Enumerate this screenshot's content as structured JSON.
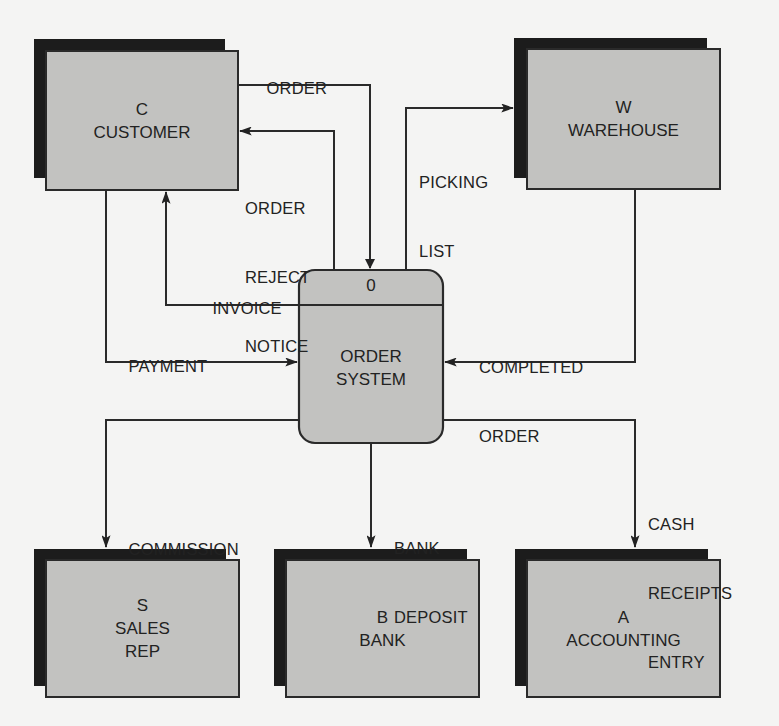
{
  "diagram": {
    "type": "context data flow diagram",
    "process": {
      "id": "0",
      "name_line1": "ORDER",
      "name_line2": "SYSTEM"
    },
    "entities": {
      "customer": {
        "code": "C",
        "name": "CUSTOMER"
      },
      "warehouse": {
        "code": "W",
        "name": "WAREHOUSE"
      },
      "sales_rep": {
        "code": "S",
        "name_line1": "SALES",
        "name_line2": "REP"
      },
      "bank": {
        "code": "B",
        "name": "BANK"
      },
      "accounting": {
        "code": "A",
        "name": "ACCOUNTING"
      }
    },
    "flows": {
      "order": {
        "line1": "ORDER",
        "from": "CUSTOMER",
        "to": "ORDER SYSTEM"
      },
      "order_reject": {
        "line1": "ORDER",
        "line2": "REJECT",
        "line3": "NOTICE",
        "from": "ORDER SYSTEM",
        "to": "CUSTOMER"
      },
      "invoice": {
        "line1": "INVOICE",
        "from": "ORDER SYSTEM",
        "to": "CUSTOMER"
      },
      "payment": {
        "line1": "PAYMENT",
        "from": "CUSTOMER",
        "to": "ORDER SYSTEM"
      },
      "picking_list": {
        "line1": "PICKING",
        "line2": "LIST",
        "from": "ORDER SYSTEM",
        "to": "WAREHOUSE"
      },
      "completed_order": {
        "line1": "COMPLETED",
        "line2": "ORDER",
        "from": "WAREHOUSE",
        "to": "ORDER SYSTEM"
      },
      "commission": {
        "line1": "COMMISSION",
        "from": "ORDER SYSTEM",
        "to": "SALES REP"
      },
      "bank_deposit": {
        "line1": "BANK",
        "line2": "DEPOSIT",
        "from": "ORDER SYSTEM",
        "to": "BANK"
      },
      "cash_receipts": {
        "line1": "CASH",
        "line2": "RECEIPTS",
        "line3": "ENTRY",
        "from": "ORDER SYSTEM",
        "to": "ACCOUNTING"
      }
    },
    "colors": {
      "fill": "#c2c2c0",
      "shadow": "#1c1c1c",
      "stroke": "#2a2a2a",
      "background": "#f4f4f3"
    }
  }
}
